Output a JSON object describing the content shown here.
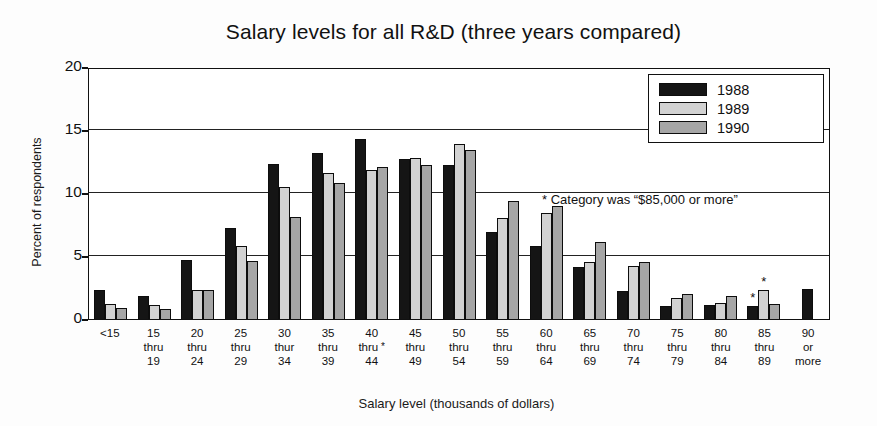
{
  "chart_data": {
    "type": "bar",
    "title": "Salary levels for all R&D (three years compared)",
    "xlabel": "Salary level (thousands of dollars)",
    "ylabel": "Percent of respondents",
    "ylim": [
      0,
      20
    ],
    "yticks": [
      0,
      5,
      10,
      15,
      20
    ],
    "grid": true,
    "legend_position": "top-right",
    "annotation": "* Category was “$85,000 or more”",
    "categories": [
      "<15",
      "15 thru 19",
      "20 thru 24",
      "25 thru 29",
      "30 thur 34",
      "35 thru 39",
      "40 thru 44",
      "45 thru 49",
      "50 thru 54",
      "55 thru 59",
      "60 thru 64",
      "65 thru 69",
      "70 thru 74",
      "75 thru 79",
      "80 thru 84",
      "85 thru 89",
      "90 or more"
    ],
    "category_lines": [
      [
        "<15",
        "",
        ""
      ],
      [
        "15",
        "thru",
        "19"
      ],
      [
        "20",
        "thru",
        "24"
      ],
      [
        "25",
        "thru",
        "29"
      ],
      [
        "30",
        "thur",
        "34"
      ],
      [
        "35",
        "thru",
        "39"
      ],
      [
        "40",
        "thru",
        "44"
      ],
      [
        "45",
        "thru",
        "49"
      ],
      [
        "50",
        "thru",
        "54"
      ],
      [
        "55",
        "thru",
        "59"
      ],
      [
        "60",
        "thru",
        "64"
      ],
      [
        "65",
        "thru",
        "69"
      ],
      [
        "70",
        "thru",
        "74"
      ],
      [
        "75",
        "thru",
        "79"
      ],
      [
        "80",
        "thru",
        "84"
      ],
      [
        "85",
        "thru",
        "89"
      ],
      [
        "90",
        "or",
        "more"
      ]
    ],
    "category_star_index": 6,
    "series": [
      {
        "name": "1988",
        "color": "#151515",
        "values": [
          2.3,
          1.8,
          4.7,
          7.2,
          12.3,
          13.2,
          14.3,
          12.7,
          12.2,
          6.9,
          5.8,
          4.1,
          2.2,
          1.0,
          1.1,
          1.0,
          2.4
        ]
      },
      {
        "name": "1989",
        "color": "#d2d2d2",
        "values": [
          1.2,
          1.1,
          2.3,
          5.8,
          10.5,
          11.6,
          11.8,
          12.8,
          13.9,
          8.0,
          8.4,
          4.5,
          4.2,
          1.7,
          1.3,
          2.3,
          null
        ]
      },
      {
        "name": "1990",
        "color": "#a6a6a6",
        "values": [
          0.9,
          0.8,
          2.3,
          4.6,
          8.1,
          10.8,
          12.1,
          12.2,
          13.4,
          9.4,
          9.0,
          6.1,
          4.5,
          2.0,
          1.8,
          1.2,
          null
        ]
      }
    ],
    "starred_bars": [
      {
        "category_index": 15,
        "series_index": 0
      },
      {
        "category_index": 15,
        "series_index": 1
      }
    ]
  },
  "legend": {
    "entries": [
      {
        "label": "1988"
      },
      {
        "label": "1989"
      },
      {
        "label": "1990"
      }
    ]
  }
}
